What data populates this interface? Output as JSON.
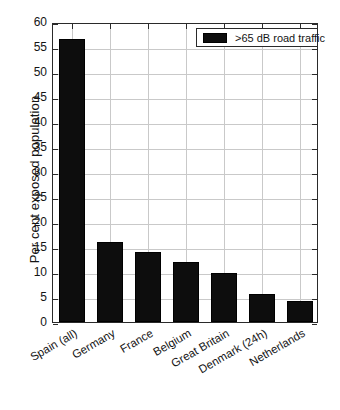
{
  "chart_data": {
    "type": "bar",
    "title": "",
    "subtitle": "",
    "xlabel": "",
    "ylabel": "Per cent exposed population",
    "ylim": [
      0,
      60
    ],
    "ytick_labels": [
      "0",
      "5",
      "10",
      "15",
      "20",
      "25",
      "30",
      "35",
      "40",
      "45",
      "50",
      "55",
      "60"
    ],
    "ytick_values": [
      0,
      5,
      10,
      15,
      20,
      25,
      30,
      35,
      40,
      45,
      50,
      55,
      60
    ],
    "grid": "both",
    "legend_position": "top-right",
    "legend": [
      ">65 dB road traffic"
    ],
    "categories": [
      "Spain (all)",
      "Germany",
      "France",
      "Belgium",
      "Great Britain",
      "Denmark (24h)",
      "Netherlands"
    ],
    "series": [
      {
        "name": ">65 dB road traffic",
        "color": "#0d0d0d",
        "values": [
          56.7,
          16.0,
          14.0,
          12.0,
          9.8,
          5.6,
          4.3
        ]
      }
    ]
  },
  "legend": {
    "label": ">65 dB road traffic",
    "swatch_color": "#0d0d0d"
  },
  "axes": {
    "y_title": "Per cent exposed population"
  }
}
